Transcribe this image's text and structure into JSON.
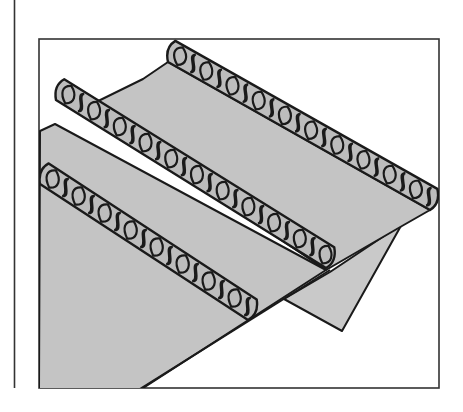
{
  "figure": {
    "colors": {
      "background": "#ffffff",
      "fabric": "#c4c4c4",
      "fabric_fold": "#c9c9c9",
      "stitch_fill": "#bdbdbd",
      "outline": "#1a1a1a",
      "frame": "#333333"
    },
    "seams": [
      {
        "label": "top-seam",
        "start": [
          168,
          62
        ],
        "end": [
          430,
          210
        ],
        "loops": 20
      },
      {
        "label": "middle-seam",
        "start": [
          56,
          100
        ],
        "end": [
          326,
          268
        ],
        "loops": 21
      },
      {
        "label": "bottom-seam",
        "start": [
          40,
          184
        ],
        "end": [
          248,
          320
        ],
        "loops": 16
      }
    ]
  }
}
